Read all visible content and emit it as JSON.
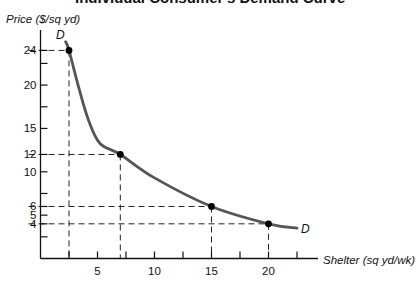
{
  "chart_data": {
    "type": "line",
    "title": "Individual Consumer's Demand Curve",
    "xlabel": "Shelter (sq yd/wk)",
    "ylabel": "Price ($/sq yd)",
    "xlim": [
      0,
      24
    ],
    "ylim": [
      0,
      26
    ],
    "grid": false,
    "legend": null,
    "x_ticks": [
      2.5,
      5,
      7.5,
      10,
      12.5,
      15,
      17.5,
      20,
      22.5
    ],
    "x_tick_labels": {
      "5": "5",
      "10": "10",
      "15": "15",
      "20": "20"
    },
    "y_ticks": [
      2.5,
      4,
      5,
      6,
      7.5,
      10,
      12,
      15,
      17.5,
      20,
      22.5,
      24
    ],
    "y_tick_labels": {
      "4": "4",
      "5": "5",
      "6": "6",
      "10": "10",
      "12": "12",
      "15": "15",
      "20": "20",
      "24": "24"
    },
    "series": [
      {
        "name": "D",
        "curve_label_start": "D",
        "curve_label_end": "D",
        "color": "#555555",
        "curve": [
          [
            2.2,
            25
          ],
          [
            2.5,
            24
          ],
          [
            3.4,
            19.5
          ],
          [
            4.2,
            16
          ],
          [
            5.2,
            13.3
          ],
          [
            7,
            12
          ],
          [
            10,
            9.3
          ],
          [
            15,
            6
          ],
          [
            20,
            4
          ],
          [
            22.5,
            3.5
          ]
        ],
        "marked_points": [
          {
            "x": 2.5,
            "y": 24
          },
          {
            "x": 7,
            "y": 12
          },
          {
            "x": 15,
            "y": 6
          },
          {
            "x": 20,
            "y": 4
          }
        ]
      }
    ],
    "annotations": [
      "Dashed guide lines from each marked point to both axes"
    ]
  }
}
